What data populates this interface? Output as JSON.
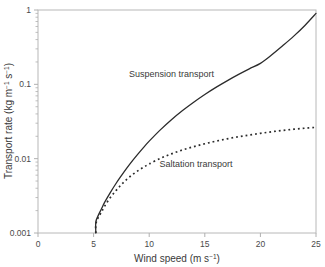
{
  "chart_data": {
    "type": "line",
    "title": "",
    "xlabel": "Wind speed (m s-1)",
    "xlabel_parts": {
      "base": "Wind speed (m s",
      "sup": "−1",
      "tail": ")"
    },
    "ylabel": "Transport rate (kg m-1 s-1)",
    "ylabel_parts": {
      "base": "Transport rate (kg m",
      "sup1": "−1",
      "mid": " s",
      "sup2": "−1",
      "tail": ")"
    },
    "xscale": "linear",
    "yscale": "log",
    "xlim": [
      0,
      25
    ],
    "ylim": [
      0.001,
      1
    ],
    "grid": false,
    "legend_position": "inline-annotations",
    "xticks": [
      0,
      5,
      10,
      15,
      20,
      25
    ],
    "xtick_labels": [
      "0",
      "5",
      "10",
      "15",
      "20",
      "25"
    ],
    "yticks": [
      0.001,
      0.01,
      0.1,
      1
    ],
    "ytick_labels": [
      "0.001",
      "0.01",
      "0.1",
      "1"
    ],
    "threshold_wind_speed": 5.2,
    "series": [
      {
        "name": "Suspension transport",
        "style": "solid",
        "color": "#2b2b2b",
        "label_x": 12.0,
        "label_y": 0.125,
        "x": [
          5.2,
          5.2,
          5.4,
          5.7,
          6.0,
          6.5,
          7.0,
          7.5,
          8.0,
          8.5,
          9.0,
          9.5,
          10.0,
          11.0,
          12.0,
          13.0,
          14.0,
          15.0,
          16.0,
          17.0,
          18.0,
          19.0,
          20.0,
          21.0,
          22.0,
          23.0,
          24.0,
          25.0
        ],
        "y": [
          0.001,
          0.0014,
          0.0017,
          0.0021,
          0.0026,
          0.0035,
          0.0046,
          0.0059,
          0.0075,
          0.0094,
          0.0116,
          0.0142,
          0.0172,
          0.0244,
          0.0334,
          0.0444,
          0.0575,
          0.073,
          0.091,
          0.1115,
          0.135,
          0.1615,
          0.1915,
          0.248,
          0.33,
          0.445,
          0.62,
          0.9
        ]
      },
      {
        "name": "Saltation transport",
        "style": "dotted",
        "color": "#2b2b2b",
        "label_x": 14.2,
        "label_y": 0.0078,
        "x": [
          5.2,
          5.2,
          5.4,
          5.7,
          6.0,
          6.5,
          7.0,
          7.5,
          8.0,
          8.5,
          9.0,
          9.5,
          10.0,
          11.0,
          12.0,
          13.0,
          14.0,
          15.0,
          16.0,
          17.0,
          18.0,
          19.0,
          20.0,
          21.0,
          22.0,
          23.0,
          24.0,
          25.0
        ],
        "y": [
          0.001,
          0.0013,
          0.0016,
          0.0019,
          0.0023,
          0.003,
          0.0037,
          0.0045,
          0.0053,
          0.0061,
          0.0069,
          0.0077,
          0.0085,
          0.0101,
          0.0116,
          0.0131,
          0.0145,
          0.0159,
          0.0172,
          0.0185,
          0.0197,
          0.0208,
          0.0219,
          0.023,
          0.024,
          0.0249,
          0.0257,
          0.0264
        ]
      }
    ]
  },
  "axes": {
    "frame_color": "#b8b8b8",
    "tick_color": "#b0b0b0"
  }
}
